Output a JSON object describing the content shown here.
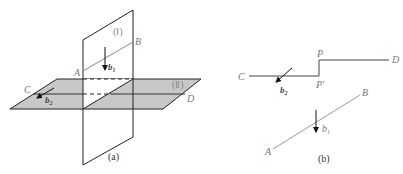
{
  "figure_a": {
    "caption": "(a)",
    "plane_1_label": "(Ⅰ)",
    "plane_2_label": "(Ⅱ)",
    "point_A": "A",
    "point_B": "B",
    "point_C": "C",
    "point_D": "D",
    "vector_b1": "b",
    "vector_b1_sub": "1",
    "vector_b2": "b",
    "vector_b2_sub": "2"
  },
  "figure_b": {
    "caption": "(b)",
    "point_A": "A",
    "point_B": "B",
    "point_C": "C",
    "point_D": "D",
    "point_P": "P",
    "point_P_prime": "P′",
    "vector_b1": "b",
    "vector_b1_sub": "1",
    "vector_b2": "b",
    "vector_b2_sub": "2"
  },
  "colors": {
    "plane_fill": "#c8c8c8",
    "line": "#222222",
    "light_line": "#999999"
  }
}
